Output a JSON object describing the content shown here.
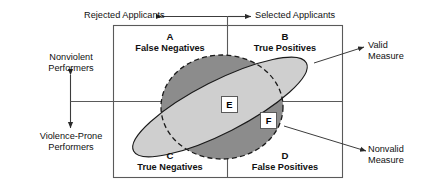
{
  "diagram": {
    "axes": {
      "top": {
        "left_label": "Rejected Applicants",
        "right_label": "Selected Applicants",
        "arrow_style": "double-headed-horizontal"
      },
      "left": {
        "top_label_line1": "Nonviolent",
        "top_label_line2": "Performers",
        "bottom_label_line1": "Violence-Prone",
        "bottom_label_line2": "Performers",
        "arrow_style": "double-headed-vertical"
      }
    },
    "quadrants": [
      {
        "letter": "A",
        "label": "False Negatives",
        "position": "top-left"
      },
      {
        "letter": "B",
        "label": "True Positives",
        "position": "top-right"
      },
      {
        "letter": "C",
        "label": "True Negatives",
        "position": "bottom-left"
      },
      {
        "letter": "D",
        "label": "False Positives",
        "position": "bottom-right"
      }
    ],
    "markers": [
      {
        "letter": "E",
        "on": "valid-measure-ellipse"
      },
      {
        "letter": "F",
        "on": "nonvalid-measure-ellipse"
      }
    ],
    "callouts": [
      {
        "id": "valid-measure",
        "line1": "Valid",
        "line2": "Measure",
        "points_to": "light-tilted-ellipse"
      },
      {
        "id": "nonvalid-measure",
        "line1": "Nonvalid",
        "line2": "Measure",
        "points_to": "dark-dashed-ellipse"
      }
    ],
    "shapes": {
      "dark_ellipse": {
        "name": "nonvalid-measure-ellipse",
        "fill": "#8c8c8c",
        "stroke": "#1a1a1a",
        "stroke_style": "dashed"
      },
      "light_ellipse": {
        "name": "valid-measure-ellipse",
        "fill": "#cfcfcf",
        "stroke": "#1a1a1a",
        "stroke_style": "solid",
        "rotation_deg": -27
      },
      "frame": {
        "name": "quadrant-frame",
        "stroke": "#5a5a5a"
      }
    },
    "colors": {
      "frame_line": "#5a5a5a",
      "axis_line": "#3c3c3c",
      "dark_fill": "#8c8c8c",
      "light_fill": "#cfcfcf",
      "text": "#111111",
      "background": "#ffffff"
    }
  }
}
